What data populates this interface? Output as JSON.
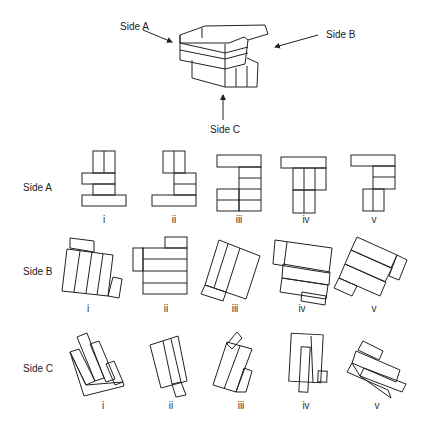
{
  "model": {
    "labels": {
      "side_a": "Side A",
      "side_b": "Side B",
      "side_c": "Side C"
    }
  },
  "rows": [
    {
      "label": "Side A",
      "options": [
        "i",
        "ii",
        "iii",
        "iv",
        "v"
      ]
    },
    {
      "label": "Side B",
      "options": [
        "i",
        "ii",
        "iii",
        "iv",
        "v"
      ]
    },
    {
      "label": "Side C",
      "options": [
        "i",
        "ii",
        "iii",
        "iv",
        "v"
      ]
    }
  ],
  "colors": {
    "line": "#222222",
    "background": "#ffffff"
  }
}
